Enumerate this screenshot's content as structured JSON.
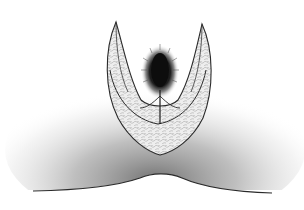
{
  "illustration": {
    "subject": "sectional botanical sketch",
    "style": "pen-and-stipple engraving, grayscale",
    "background_color": "#ffffff",
    "ink_color": "#2a2a2a",
    "shading_color": "#6e6e6e",
    "core_color": "#111111",
    "parts": [
      {
        "name": "outer-v-sheath",
        "description": "V-shaped outer envelope with two pointed lobes"
      },
      {
        "name": "inner-v-layer",
        "description": "inner parallel V-shaped layer"
      },
      {
        "name": "central-bud",
        "description": "dark elliptical bristled core at center"
      },
      {
        "name": "stalk-line",
        "description": "vertical line below the central bud"
      },
      {
        "name": "ground-mound",
        "description": "shaded mound with a wavy baseline"
      }
    ]
  }
}
